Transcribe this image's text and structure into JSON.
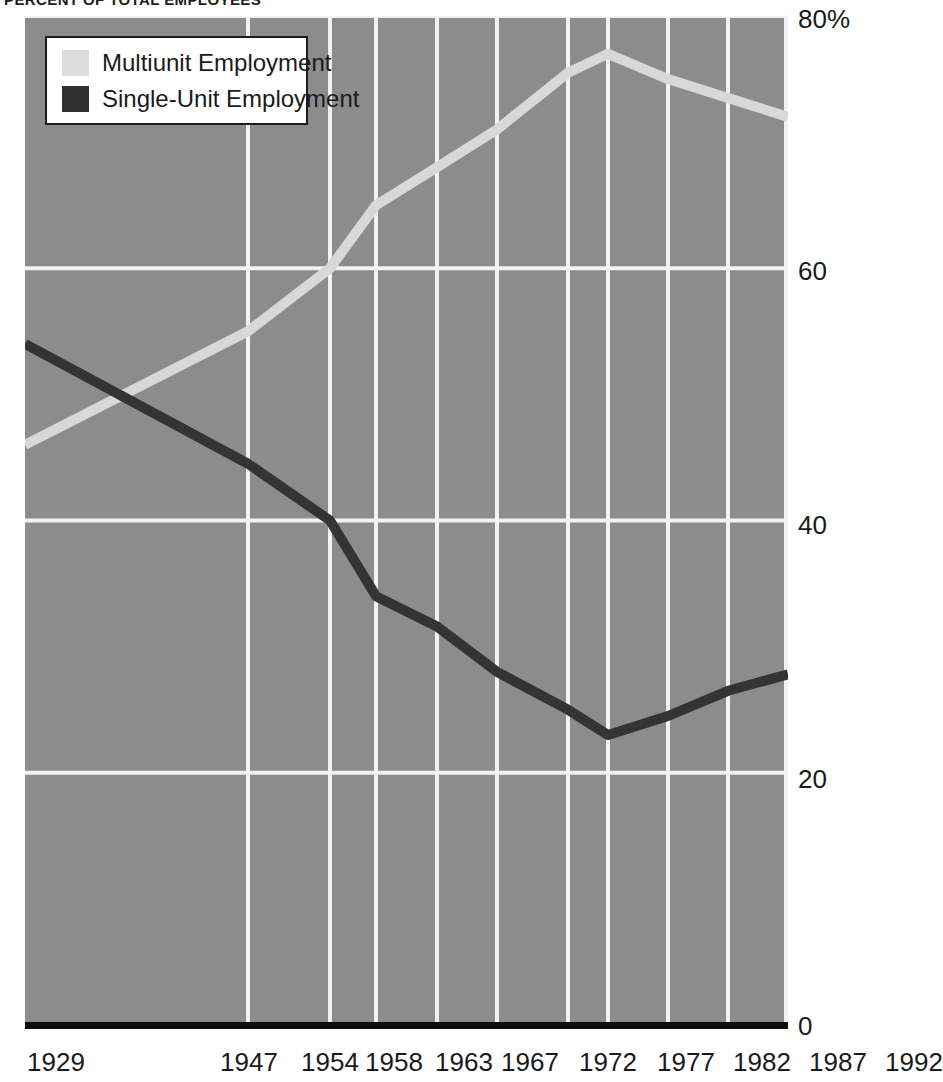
{
  "title": "PERCENT OF TOTAL EMPLOYEES",
  "colors": {
    "plot_background": "#8c8c8c",
    "gridline": "#f2f2f2",
    "axis_baseline": "#0d0d0d",
    "multiunit_line": "#d8d8d8",
    "single_unit_line": "#343434",
    "text": "#1a1a1a",
    "legend_background": "#ffffff",
    "legend_border": "#1c1c1c"
  },
  "legend": {
    "position": "top-left",
    "entries": [
      {
        "label": "Multiunit Employment",
        "color": "#dcdcdc",
        "swatch": "multiunit-swatch"
      },
      {
        "label": "Single-Unit Employment",
        "color": "#303030",
        "swatch": "single-unit-swatch"
      }
    ]
  },
  "axes": {
    "y": {
      "ticks": [
        "80%",
        "60",
        "40",
        "20",
        "0"
      ],
      "values": [
        80,
        60,
        40,
        20,
        0
      ],
      "min": 0,
      "max": 80
    },
    "x": {
      "ticks": [
        "1929",
        "1947",
        "1954",
        "1958",
        "1963",
        "1967",
        "1972",
        "1977",
        "1982",
        "1987",
        "1992"
      ],
      "values": [
        1929,
        1947,
        1954,
        1958,
        1963,
        1967,
        1972,
        1977,
        1982,
        1987,
        1992
      ]
    }
  },
  "chart_data": {
    "type": "line",
    "title": "PERCENT OF TOTAL EMPLOYEES",
    "xlabel": "",
    "ylabel": "",
    "ylim": [
      0,
      80
    ],
    "grid": true,
    "legend_position": "top-left",
    "categories": [
      "1929",
      "1947",
      "1954",
      "1958",
      "1963",
      "1967",
      "1972",
      "1977",
      "1982",
      "1987",
      "1992"
    ],
    "x": [
      1929,
      1947,
      1954,
      1958,
      1963,
      1967,
      1972,
      1977,
      1982,
      1987,
      1992
    ],
    "series": [
      {
        "name": "Multiunit Employment",
        "color": "#d8d8d8",
        "values": [
          46.0,
          55.0,
          60.0,
          65.0,
          68.0,
          71.0,
          75.5,
          77.0,
          75.0,
          73.5,
          72.0
        ]
      },
      {
        "name": "Single-Unit Employment",
        "color": "#343434",
        "values": [
          54.0,
          44.5,
          40.0,
          34.0,
          31.6,
          28.0,
          25.0,
          23.0,
          24.5,
          26.5,
          27.8
        ]
      }
    ]
  }
}
